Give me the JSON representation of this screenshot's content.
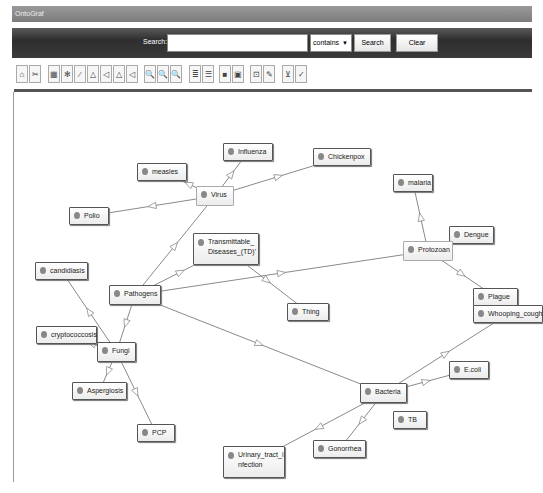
{
  "app": {
    "title": "OntoGraf"
  },
  "search": {
    "label": "Search:",
    "value": "",
    "placeholder": "",
    "mode": "contains",
    "search_button": "Search",
    "clear_button": "Clear"
  },
  "toolbar": {
    "buttons": [
      {
        "icon": "home-icon",
        "glyph": "⌂"
      },
      {
        "icon": "scissors-icon",
        "glyph": "✂"
      },
      {
        "icon": "grid-layout-icon",
        "glyph": "▦"
      },
      {
        "icon": "spring-layout-icon",
        "glyph": "✻"
      },
      {
        "icon": "diagonal-layout-icon",
        "glyph": "⁄"
      },
      {
        "icon": "vertical-tree-icon",
        "glyph": "△"
      },
      {
        "icon": "horizontal-tree-icon",
        "glyph": "◁"
      },
      {
        "icon": "vertical-tree-alt-icon",
        "glyph": "△"
      },
      {
        "icon": "horizontal-tree-alt-icon",
        "glyph": "◁"
      },
      {
        "icon": "zoom-in-icon",
        "glyph": "🔍"
      },
      {
        "icon": "zoom-out-icon",
        "glyph": "🔍"
      },
      {
        "icon": "zoom-fit-icon",
        "glyph": "🔍"
      },
      {
        "icon": "node-filter-icon",
        "glyph": "≣"
      },
      {
        "icon": "arc-filter-icon",
        "glyph": "☰"
      },
      {
        "icon": "record-icon",
        "glyph": "■"
      },
      {
        "icon": "note-icon",
        "glyph": "▣"
      },
      {
        "icon": "export-icon",
        "glyph": "⊡"
      },
      {
        "icon": "edit-icon",
        "glyph": "✎"
      },
      {
        "icon": "save-image-icon",
        "glyph": "⊻"
      },
      {
        "icon": "check-icon",
        "glyph": "✓"
      }
    ]
  },
  "graph": {
    "nodes": [
      {
        "id": "influenza",
        "label": "Influenza"
      },
      {
        "id": "chickenpox",
        "label": "Chickenpox"
      },
      {
        "id": "measles",
        "label": "measles"
      },
      {
        "id": "virus",
        "label": "Virus"
      },
      {
        "id": "polio",
        "label": "Polio"
      },
      {
        "id": "td",
        "label": "Transmittable_ Diseases_(TD)'"
      },
      {
        "id": "malaria",
        "label": "malaria"
      },
      {
        "id": "dengue",
        "label": "Dengue"
      },
      {
        "id": "protozoan",
        "label": "Protozoan"
      },
      {
        "id": "candidiasis",
        "label": "candidiasis"
      },
      {
        "id": "pathogens",
        "label": "Pathogens"
      },
      {
        "id": "thing",
        "label": "Thing"
      },
      {
        "id": "plague",
        "label": "Plague"
      },
      {
        "id": "whooping",
        "label": "Whooping_cough"
      },
      {
        "id": "crypto",
        "label": "cryptococcosis"
      },
      {
        "id": "fungi",
        "label": "Fungi"
      },
      {
        "id": "ecoli",
        "label": "E.coli"
      },
      {
        "id": "asperg",
        "label": "Aspergiosis"
      },
      {
        "id": "bacteria",
        "label": "Bacteria"
      },
      {
        "id": "tb",
        "label": "TB"
      },
      {
        "id": "pcp",
        "label": "PCP"
      },
      {
        "id": "gonorrhea",
        "label": "Gonorrhea"
      },
      {
        "id": "uti",
        "label": "Urinary_tract_i nfection"
      }
    ],
    "edges": [
      [
        "virus",
        "influenza"
      ],
      [
        "virus",
        "chickenpox"
      ],
      [
        "virus",
        "measles"
      ],
      [
        "virus",
        "polio"
      ],
      [
        "pathogens",
        "virus"
      ],
      [
        "pathogens",
        "td"
      ],
      [
        "pathogens",
        "protozoan"
      ],
      [
        "pathogens",
        "bacteria"
      ],
      [
        "td",
        "thing"
      ],
      [
        "pathogens",
        "fungi"
      ],
      [
        "protozoan",
        "malaria"
      ],
      [
        "protozoan",
        "plague"
      ],
      [
        "fungi",
        "candidiasis"
      ],
      [
        "fungi",
        "crypto"
      ],
      [
        "fungi",
        "asperg"
      ],
      [
        "fungi",
        "pcp"
      ],
      [
        "bacteria",
        "whooping"
      ],
      [
        "bacteria",
        "ecoli"
      ],
      [
        "bacteria",
        "gonorrhea"
      ],
      [
        "bacteria",
        "uti"
      ]
    ]
  }
}
